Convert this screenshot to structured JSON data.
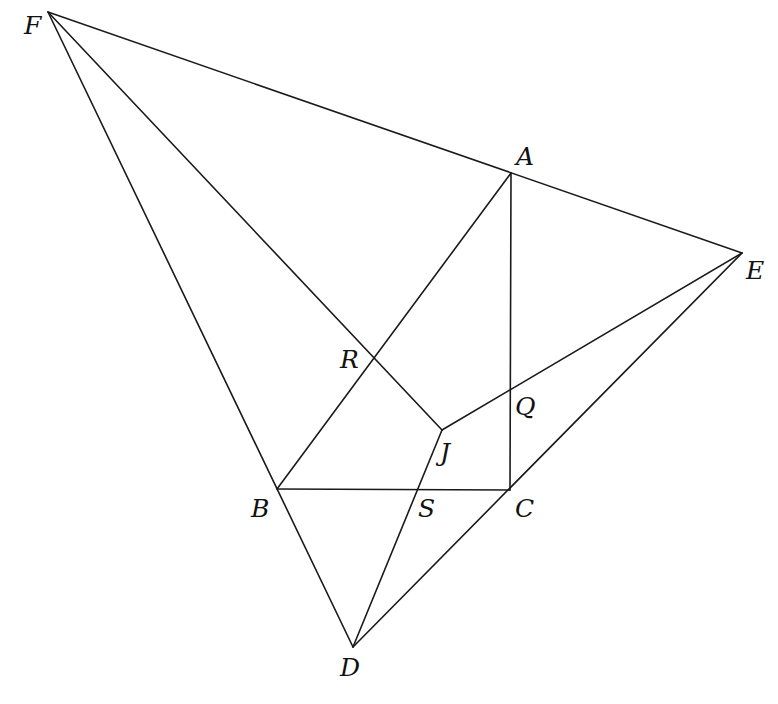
{
  "figure": {
    "type": "geometry-diagram",
    "stroke_color": "#1a1a1a",
    "points": {
      "F": {
        "x": 48,
        "y": 12
      },
      "A": {
        "x": 511,
        "y": 173
      },
      "E": {
        "x": 742,
        "y": 253
      },
      "R": {
        "x": 374,
        "y": 357
      },
      "Q": {
        "x": 510,
        "y": 392
      },
      "J": {
        "x": 442,
        "y": 430
      },
      "B": {
        "x": 277,
        "y": 489
      },
      "S": {
        "x": 420,
        "y": 490
      },
      "C": {
        "x": 510,
        "y": 490
      },
      "D": {
        "x": 353,
        "y": 647
      }
    },
    "segments": [
      [
        "F",
        "E"
      ],
      [
        "F",
        "D"
      ],
      [
        "F",
        "J"
      ],
      [
        "A",
        "B"
      ],
      [
        "A",
        "C"
      ],
      [
        "B",
        "C"
      ],
      [
        "E",
        "J"
      ],
      [
        "E",
        "D"
      ],
      [
        "J",
        "D"
      ]
    ],
    "labels": [
      {
        "text": "F",
        "x": 24,
        "y": 34
      },
      {
        "text": "A",
        "x": 516,
        "y": 165
      },
      {
        "text": "E",
        "x": 746,
        "y": 279
      },
      {
        "text": "R",
        "x": 340,
        "y": 368
      },
      {
        "text": "Q",
        "x": 515,
        "y": 415
      },
      {
        "text": "J",
        "x": 440,
        "y": 461
      },
      {
        "text": "B",
        "x": 251,
        "y": 517
      },
      {
        "text": "S",
        "x": 418,
        "y": 517
      },
      {
        "text": "C",
        "x": 515,
        "y": 517
      },
      {
        "text": "D",
        "x": 340,
        "y": 676
      }
    ]
  }
}
